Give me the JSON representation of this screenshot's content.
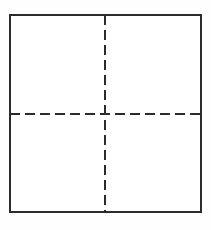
{
  "figure": {
    "name": "square-quadrant-diagram",
    "canvas": {
      "width": 211,
      "height": 230,
      "background_color": "#fefefe"
    },
    "square": {
      "label": "square-outline",
      "x": 10,
      "y": 15,
      "width": 191,
      "height": 197,
      "stroke_color": "#2b2b2b",
      "stroke_width": 2,
      "fill_color": "#ffffff",
      "line_style": "solid"
    },
    "centerlines": {
      "stroke_color": "#2b2b2b",
      "stroke_width": 2,
      "line_style": "dashed",
      "dash_length": 10,
      "gap_length": 5,
      "items": [
        {
          "label": "vertical-centerline",
          "orientation": "vertical",
          "x1": 105,
          "y1": 15,
          "x2": 105,
          "y2": 212
        },
        {
          "label": "horizontal-centerline",
          "orientation": "horizontal",
          "x1": 10,
          "y1": 114,
          "x2": 201,
          "y2": 114
        }
      ]
    },
    "center_point": {
      "label": "centerline-intersection",
      "x": 105,
      "y": 114
    },
    "quadrants": [
      {
        "label": "top-left-quadrant",
        "x": 10,
        "y": 15,
        "width": 95,
        "height": 99
      },
      {
        "label": "top-right-quadrant",
        "x": 105,
        "y": 15,
        "width": 96,
        "height": 99
      },
      {
        "label": "bottom-left-quadrant",
        "x": 10,
        "y": 114,
        "width": 95,
        "height": 98
      },
      {
        "label": "bottom-right-quadrant",
        "x": 105,
        "y": 114,
        "width": 96,
        "height": 98
      }
    ]
  }
}
